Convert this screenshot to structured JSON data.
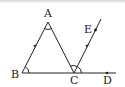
{
  "diagram": {
    "type": "geometry",
    "points": {
      "A": {
        "label": "A",
        "x": 48,
        "y": 22
      },
      "B": {
        "label": "B",
        "x": 22,
        "y": 73
      },
      "C": {
        "label": "C",
        "x": 74,
        "y": 73
      },
      "D": {
        "label": "D",
        "x": 107,
        "y": 73
      },
      "E": {
        "label": "E",
        "x": 95,
        "y": 30
      }
    },
    "segments": [
      "AB",
      "AC",
      "BD",
      "CE"
    ],
    "parallel_marks": [
      "AB",
      "CE"
    ],
    "angle_marks": [
      "A",
      "B",
      "ACB",
      "ECD"
    ],
    "line_color": "#222222"
  }
}
